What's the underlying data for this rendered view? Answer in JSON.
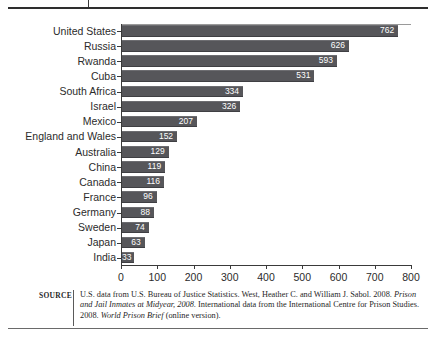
{
  "chart_data": {
    "type": "bar",
    "orientation": "horizontal",
    "title": "",
    "xlabel": "",
    "ylabel": "",
    "xlim": [
      0,
      800
    ],
    "xticks": [
      0,
      100,
      200,
      300,
      400,
      500,
      600,
      700,
      800
    ],
    "grid": false,
    "legend": null,
    "bar_color": "#56565a",
    "value_label_color": "#ffffff",
    "categories": [
      "United States",
      "Russia",
      "Rwanda",
      "Cuba",
      "South Africa",
      "Israel",
      "Mexico",
      "England and Wales",
      "Australia",
      "China",
      "Canada",
      "France",
      "Germany",
      "Sweden",
      "Japan",
      "India"
    ],
    "values": [
      762,
      626,
      593,
      531,
      334,
      326,
      207,
      152,
      129,
      119,
      116,
      96,
      88,
      74,
      63,
      33
    ]
  },
  "source": {
    "label": "SOURCE",
    "line1_a": "U.S. data from U.S. Bureau of Justice Statistics. West, Heather C. and William J. Sabol. 2008. ",
    "line1_italic": "Prison and Jail Inmates at Midyear, 2008",
    "line2_a": ". International data from the International Centre for Prison Studies. 2008. ",
    "line2_italic": "World Prison Brief",
    "line2_b": " (online version)."
  }
}
